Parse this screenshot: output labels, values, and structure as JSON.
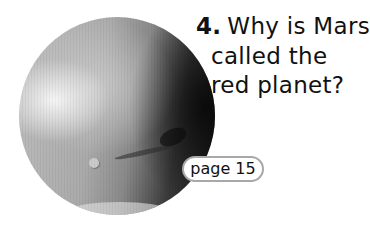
{
  "illustration": {
    "subject": "Mars",
    "icon": "planet-mars-image"
  },
  "question": {
    "number": "4.",
    "lines": [
      "Why is Mars",
      "called the",
      "red planet?"
    ]
  },
  "page_reference": {
    "label": "page 15"
  },
  "colors": {
    "text": "#111111",
    "pill_border": "#a8a8a8",
    "background": "#ffffff"
  }
}
